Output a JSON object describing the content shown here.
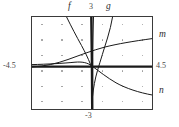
{
  "figure": {
    "background_color": "#ffffff",
    "frame_color": "#3a3a3a",
    "curve_color": "#1a1a1a",
    "grid_dot_color": "#9a9a9a"
  },
  "labels": {
    "curve_f": "f",
    "curve_g": "g",
    "curve_m": "m",
    "curve_n": "n",
    "y_max": "3",
    "y_min": "-3",
    "x_min": "-4.5",
    "x_max": "4.5"
  },
  "chart_data": {
    "type": "line",
    "title": "",
    "xlabel": "",
    "ylabel": "",
    "xlim": [
      -4.5,
      4.5
    ],
    "ylim": [
      -3,
      3
    ],
    "grid": true,
    "grid_style": "dots",
    "legend_position": "inline-curve-labels",
    "tick_labels": {
      "x": [
        "-4.5",
        "4.5"
      ],
      "y": [
        "-3",
        "3"
      ]
    },
    "annotations": [
      {
        "text": "f",
        "x": -0.6,
        "y": 3.0,
        "placement": "above-axis-top"
      },
      {
        "text": "3",
        "x": 0.0,
        "y": 3.0,
        "placement": "above-axis-top"
      },
      {
        "text": "g",
        "x": 1.0,
        "y": 3.0,
        "placement": "above-axis-top"
      },
      {
        "text": "m",
        "x": 4.5,
        "y": 1.3,
        "placement": "right-of-frame"
      },
      {
        "text": "n",
        "x": 4.5,
        "y": -1.5,
        "placement": "right-of-frame"
      },
      {
        "text": "-4.5",
        "x": -4.5,
        "y": 0,
        "placement": "left-of-frame"
      },
      {
        "text": "4.5",
        "x": 4.5,
        "y": 0,
        "placement": "right-of-frame"
      },
      {
        "text": "-3",
        "x": 0,
        "y": -3,
        "placement": "below-frame"
      }
    ],
    "series": [
      {
        "name": "f",
        "description": "steep curve with vertical asymptote at x = 0, descending from upper-left through the origin region",
        "x": [
          -1.9,
          -1.6,
          -1.3,
          -1.0,
          -0.7,
          -0.45,
          -0.25,
          -0.1,
          -0.03
        ],
        "y": [
          3.0,
          2.35,
          1.75,
          1.25,
          0.85,
          0.55,
          0.3,
          0.1,
          0.02
        ]
      },
      {
        "name": "f-asymptote",
        "description": "near-vertical branch at x = 0 spanning the full frame height",
        "x": [
          0.0,
          0.0
        ],
        "y": [
          3.0,
          -3.0
        ]
      },
      {
        "name": "g",
        "description": "curve rising to the upper right, passing near the origin",
        "x": [
          0.05,
          0.25,
          0.5,
          0.8,
          1.1,
          1.4,
          1.7
        ],
        "y": [
          -1.9,
          -0.75,
          0.1,
          0.9,
          1.7,
          2.4,
          3.0
        ]
      },
      {
        "name": "m",
        "description": "logarithmic-type curve rising from the left along the x-axis toward the upper right",
        "x": [
          -4.5,
          -3.5,
          -2.5,
          -1.5,
          -0.5,
          0.5,
          1.5,
          2.5,
          3.5,
          4.5
        ],
        "y": [
          -0.05,
          0.05,
          0.2,
          0.45,
          0.8,
          1.05,
          1.25,
          1.4,
          1.5,
          1.6
        ]
      },
      {
        "name": "n",
        "description": "decaying curve falling from upper-left toward the lower right",
        "x": [
          -4.5,
          -3.5,
          -2.5,
          -1.5,
          -0.5,
          0.5,
          1.5,
          2.5,
          3.5,
          4.5
        ],
        "y": [
          0.08,
          0.08,
          0.1,
          0.15,
          0.3,
          -0.15,
          -0.6,
          -1.0,
          -1.35,
          -1.6
        ]
      },
      {
        "name": "x-axis",
        "description": "thick horizontal axis line at y = 0",
        "x": [
          -4.5,
          4.5
        ],
        "y": [
          0,
          0
        ]
      }
    ]
  }
}
